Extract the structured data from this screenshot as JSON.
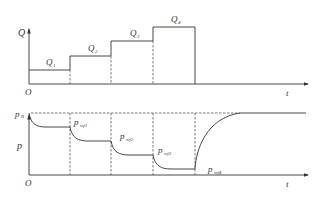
{
  "top_chart": {
    "y_axis_label": "Q",
    "x_axis_label": "t",
    "origin_label": "O",
    "steps": [
      {
        "label": "Q",
        "sub": "1"
      },
      {
        "label": "Q",
        "sub": "2"
      },
      {
        "label": "Q",
        "sub": "3"
      },
      {
        "label": "Q",
        "sub": "4"
      }
    ]
  },
  "bottom_chart": {
    "y_axis_label": "p",
    "x_axis_label": "t",
    "origin_label": "O",
    "initial_pressure": {
      "label": "p",
      "sub": "R"
    },
    "levels": [
      {
        "label": "p",
        "sub": "wf1"
      },
      {
        "label": "p",
        "sub": "wf2"
      },
      {
        "label": "p",
        "sub": "wf3"
      },
      {
        "label": "p",
        "sub": "wf4"
      }
    ]
  },
  "colors": {
    "line": "#333333",
    "dash": "#555555",
    "background": "#ffffff"
  }
}
